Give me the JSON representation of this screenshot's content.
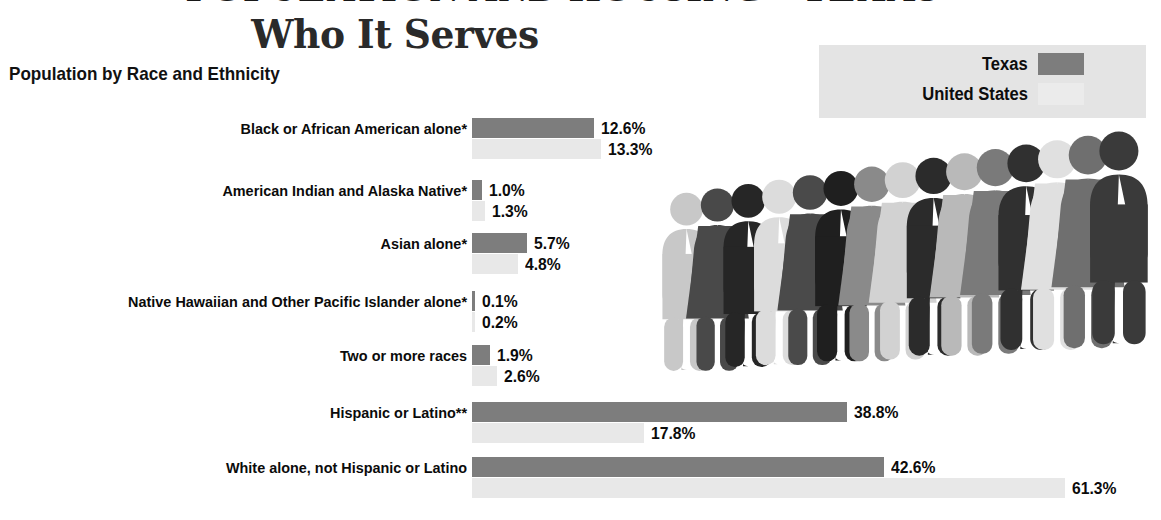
{
  "header": {
    "clipped_top_line": "POPULATION AND HOUSING  •  TEXAS",
    "title": "Who It Serves"
  },
  "section": {
    "subtitle": "Population by Race and Ethnicity"
  },
  "legend": {
    "background_color": "#e4e4e4",
    "items": [
      {
        "label": "Texas",
        "color": "#7d7d7d"
      },
      {
        "label": "United States",
        "color": "#ebebeb"
      }
    ]
  },
  "colors": {
    "texas_bar": "#7d7d7d",
    "us_bar": "#e8e8e8",
    "text": "#0b0b0b",
    "title": "#2a2a2a",
    "background": "#ffffff"
  },
  "chart_data": {
    "type": "bar",
    "orientation": "horizontal",
    "title": "Population by Race and Ethnicity",
    "xlabel": "",
    "ylabel": "",
    "xlim": [
      0,
      70
    ],
    "grid": false,
    "legend_position": "top-right",
    "units": "percent",
    "pixels_per_percent": 9.67,
    "categories": [
      "Black or African American alone*",
      "American Indian and Alaska Native*",
      "Asian alone*",
      "Native Hawaiian and Other Pacific Islander alone*",
      "Two or more races",
      "Hispanic or Latino**",
      "White alone, not Hispanic or Latino"
    ],
    "series": [
      {
        "name": "Texas",
        "color": "#7d7d7d",
        "values": [
          12.6,
          1.0,
          5.7,
          0.1,
          1.9,
          38.8,
          42.6
        ],
        "labels": [
          "12.6%",
          "1.0%",
          "5.7%",
          "0.1%",
          "1.9%",
          "38.8%",
          "42.6%"
        ]
      },
      {
        "name": "United States",
        "color": "#e8e8e8",
        "values": [
          13.3,
          1.3,
          4.8,
          0.2,
          2.6,
          17.8,
          61.3
        ],
        "labels": [
          "13.3%",
          "1.3%",
          "4.8%",
          "0.2%",
          "2.6%",
          "17.8%",
          "61.3%"
        ]
      }
    ]
  },
  "illustration": {
    "name": "crowd-of-people-figures",
    "figure_count": 15,
    "figures": [
      {
        "type": "male",
        "color": "#c8c8c8"
      },
      {
        "type": "female",
        "color": "#494949"
      },
      {
        "type": "male",
        "color": "#262626"
      },
      {
        "type": "male",
        "color": "#dcdcdc"
      },
      {
        "type": "female",
        "color": "#4a4a4a"
      },
      {
        "type": "male",
        "color": "#1f1f1f"
      },
      {
        "type": "female",
        "color": "#8a8a8a"
      },
      {
        "type": "female",
        "color": "#d2d2d2"
      },
      {
        "type": "male",
        "color": "#2b2b2b"
      },
      {
        "type": "female",
        "color": "#b9b9b9"
      },
      {
        "type": "female",
        "color": "#7a7a7a"
      },
      {
        "type": "male",
        "color": "#303030"
      },
      {
        "type": "female",
        "color": "#e0e0e0"
      },
      {
        "type": "female",
        "color": "#6f6f6f"
      },
      {
        "type": "male",
        "color": "#3a3a3a"
      }
    ]
  }
}
